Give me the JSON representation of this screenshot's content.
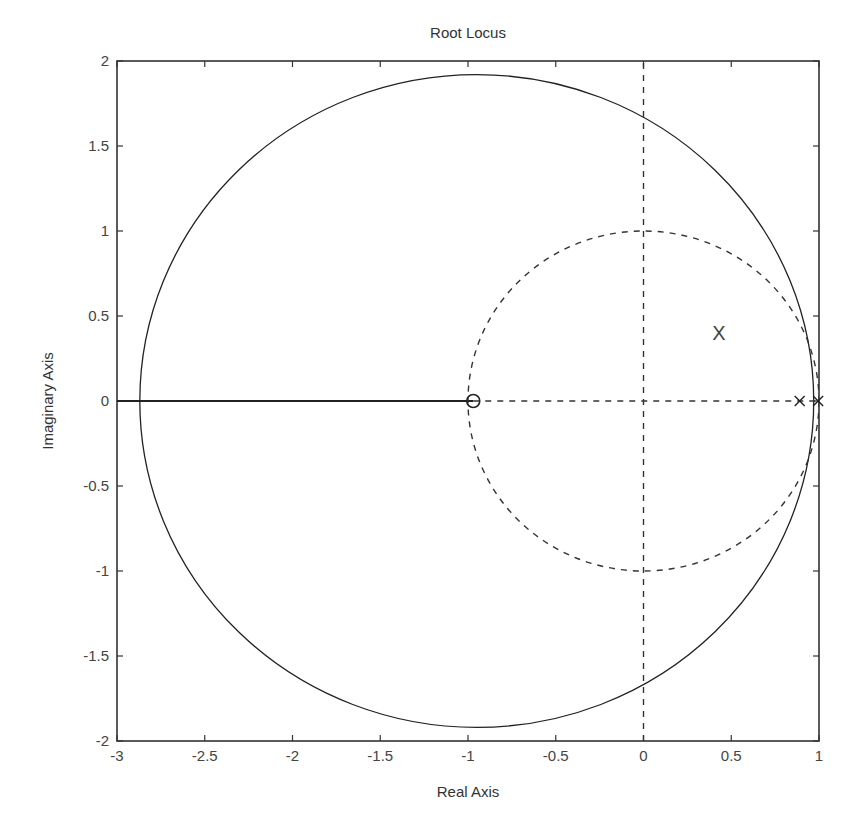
{
  "chart_data": {
    "type": "line",
    "title": "Root Locus",
    "xlabel": "Real Axis",
    "ylabel": "Imaginary Axis",
    "xlim": [
      -3,
      1
    ],
    "ylim": [
      -2,
      2
    ],
    "xticks": [
      -3,
      -2.5,
      -2,
      -1.5,
      -1,
      -0.5,
      0,
      0.5,
      1
    ],
    "xtick_labels": [
      "-3",
      "-2.5",
      "-2",
      "-1.5",
      "-1",
      "-0.5",
      "0",
      "0.5",
      "1"
    ],
    "yticks": [
      2,
      1.5,
      1,
      0.5,
      0,
      -0.5,
      -1,
      -1.5,
      -2
    ],
    "ytick_labels": [
      "2",
      "1.5",
      "1",
      "0.5",
      "0",
      "-0.5",
      "-1",
      "-1.5",
      "-2"
    ],
    "grid": false,
    "legend": null,
    "series": [
      {
        "name": "root-locus-circle",
        "style": "solid",
        "shape": "circle",
        "center": [
          -0.95,
          0
        ],
        "radius": 1.92,
        "color": "#222222"
      },
      {
        "name": "root-locus-real-axis-segment",
        "style": "solid",
        "points": [
          [
            -3,
            0
          ],
          [
            -0.97,
            0
          ]
        ],
        "color": "#222222"
      },
      {
        "name": "unit-circle",
        "style": "dashed",
        "shape": "circle",
        "center": [
          0,
          0
        ],
        "radius": 1.0,
        "color": "#333333"
      },
      {
        "name": "real-axis-dashed",
        "style": "dashed",
        "points": [
          [
            -0.97,
            0
          ],
          [
            1,
            0
          ]
        ],
        "color": "#333333"
      },
      {
        "name": "imag-axis-dashed",
        "style": "dashed",
        "points": [
          [
            0,
            -2
          ],
          [
            0,
            2
          ]
        ],
        "color": "#333333"
      }
    ],
    "zeros": [
      [
        -0.97,
        0
      ]
    ],
    "poles": [
      [
        0.89,
        0
      ],
      [
        0.995,
        0
      ]
    ],
    "annotations": [
      {
        "text": "X",
        "x": 0.43,
        "y": 0.4
      }
    ]
  }
}
